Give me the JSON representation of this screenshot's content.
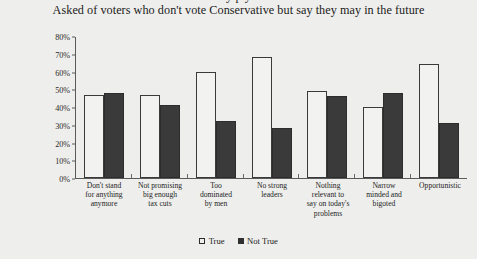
{
  "header": {
    "cut_off_line": "y p y",
    "subtitle": "Asked of voters who don't vote Conservative but say they may in the future"
  },
  "legend": {
    "items": [
      {
        "label": "True",
        "marker": "open-square-icon",
        "color": "#f2f2f0"
      },
      {
        "label": "Not True",
        "marker": "filled-square-icon",
        "color": "#3a3a3a"
      }
    ]
  },
  "axis": {
    "y_ticks": [
      "0%",
      "10%",
      "20%",
      "30%",
      "40%",
      "50%",
      "60%",
      "70%",
      "80%"
    ]
  },
  "chart_data": {
    "type": "bar",
    "title": "",
    "subtitle": "Asked of voters who don't vote Conservative but say they may in the future",
    "xlabel": "",
    "ylabel": "",
    "ylim": [
      0,
      80
    ],
    "ytick_step": 10,
    "ytick_suffix": "%",
    "grid": false,
    "legend_position": "bottom",
    "categories": [
      "Don't stand for anything anymore",
      "Not promising big enough tax cuts",
      "Too dominated by men",
      "No strong leaders",
      "Nothing relevant to say on today's problems",
      "Narrow minded and bigoted",
      "Opportunistic"
    ],
    "categories_lines": [
      [
        "Don't stand",
        "for anything",
        "anymore"
      ],
      [
        "Not promising",
        "big enough",
        "tax cuts"
      ],
      [
        "Too",
        "dominated",
        "by men"
      ],
      [
        "No strong",
        "leaders"
      ],
      [
        "Nothing",
        "relevant to",
        "say on today's",
        "problems"
      ],
      [
        "Narrow",
        "minded and",
        "bigoted"
      ],
      [
        "Opportunistic"
      ]
    ],
    "series": [
      {
        "name": "True",
        "color": "#f2f2f0",
        "values": [
          47,
          47,
          60,
          68,
          49,
          40,
          64
        ]
      },
      {
        "name": "Not True",
        "color": "#3a3a3a",
        "values": [
          48,
          41,
          32,
          28,
          46,
          48,
          31
        ]
      }
    ]
  }
}
